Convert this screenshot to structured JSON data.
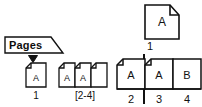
{
  "figure": {
    "background_color": "#ffffff",
    "ink_color": "#111111"
  },
  "panel_left": {
    "tab": {
      "label": "Pages",
      "icon": "tab-shape"
    },
    "drop_marker_icon": "down-triangle-marker",
    "pages": [
      {
        "icon": "page-sheet-icon",
        "letter": "A",
        "caption": "1"
      }
    ],
    "page_group": {
      "icon": "page-sheet-icon",
      "cells": [
        {
          "letter": "A"
        },
        {
          "letter": "A"
        },
        {
          "letter": ""
        }
      ],
      "caption": "[2-4]"
    }
  },
  "panel_right": {
    "single_page": {
      "icon": "page-sheet-icon",
      "letter": "A",
      "caption": "1"
    },
    "spine_icon": "spine-line",
    "spread": {
      "cells": [
        {
          "letter": "A",
          "caption": "2"
        },
        {
          "letter": "A",
          "caption": "3"
        },
        {
          "letter": "B",
          "caption": "4"
        }
      ]
    }
  }
}
